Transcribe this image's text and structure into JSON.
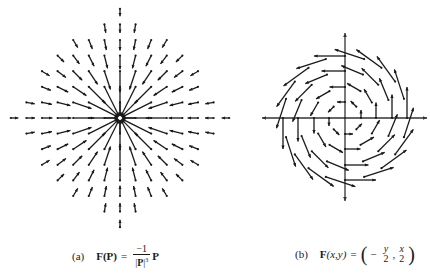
{
  "figure_a": {
    "label": "(a)",
    "formula": {
      "lhs": "F(P)",
      "equals": "=",
      "numerator": "−1",
      "denominator_bar_open": "|",
      "denominator_var": "P",
      "denominator_bar_close": "|",
      "denominator_exp": "3",
      "rhs_var": "P"
    },
    "field_type": "inverse-square radial, pointing inward",
    "center": [
      120,
      118
    ],
    "grid_spacing": 15.6,
    "row_half_widths": {
      "-7": 0,
      "-6": 1,
      "-5": 3,
      "-4": 4,
      "-3": 5,
      "-2": 5,
      "-1": 6,
      "0": 7,
      "1": 6,
      "2": 5,
      "3": 5,
      "4": 4,
      "5": 3,
      "6": 1,
      "7": 0
    },
    "arrow_color": "#1a1a1a"
  },
  "figure_b": {
    "label": "(b)",
    "formula": {
      "lhs": "F",
      "args": "(x,y)",
      "equals": "=",
      "open_paren": "(",
      "minus": "−",
      "num1": "y",
      "den1": "2",
      "comma": ",",
      "num2": "x",
      "den2": "2",
      "close_paren": ")"
    },
    "field_type": "counterclockwise rotation",
    "center": [
      95,
      118
    ],
    "axes": {
      "x_min": 12,
      "x_max": 177,
      "y_min": 33,
      "y_max": 201
    },
    "rings": [
      {
        "radius": 16,
        "count": 8
      },
      {
        "radius": 31,
        "count": 12
      },
      {
        "radius": 47,
        "count": 16
      },
      {
        "radius": 62,
        "count": 20
      }
    ],
    "arrow_color": "#1a1a1a"
  }
}
